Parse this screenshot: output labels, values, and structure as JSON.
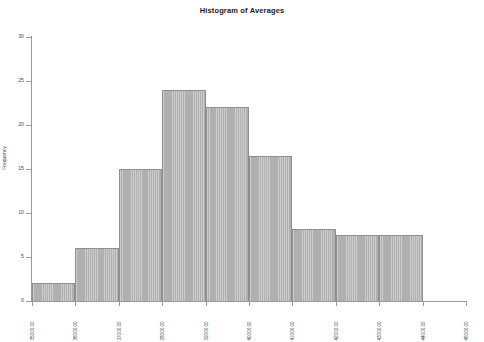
{
  "chart_data": {
    "type": "bar",
    "title": "Histogram of Averages",
    "xlabel": "",
    "ylabel": "Frequency",
    "grid": false,
    "legend": "none",
    "xlim": [
      35000,
      45000
    ],
    "ylim": [
      0,
      30
    ],
    "x_tick_labels": [
      "35000.00",
      "36000.00",
      "37000.00",
      "38000.00",
      "39000.00",
      "40000.00",
      "41000.00",
      "42000.00",
      "43000.00",
      "44000.00",
      "45000.00"
    ],
    "y_tick_labels": [
      "0",
      "5",
      "10",
      "15",
      "20",
      "25",
      "30"
    ],
    "y_tick_values": [
      0,
      5,
      10,
      15,
      20,
      25,
      30
    ],
    "bin_edges": [
      35000,
      36000,
      37000,
      38000,
      39000,
      40000,
      41000,
      42000,
      43000,
      44000
    ],
    "categories": [
      "35000-36000",
      "36000-37000",
      "37000-38000",
      "38000-39000",
      "39000-40000",
      "40000-41000",
      "41000-42000",
      "42000-43000",
      "43000-44000"
    ],
    "values": [
      2,
      6,
      15,
      24,
      22,
      16.5,
      8.2,
      7.5,
      7.5
    ],
    "bar_color": "#b6b6b6",
    "bar_edge_color": "#8f8f8f",
    "axis_color": "#9a9a9a",
    "text_color": "#4a4a4a",
    "background_color": "#ffffff"
  }
}
